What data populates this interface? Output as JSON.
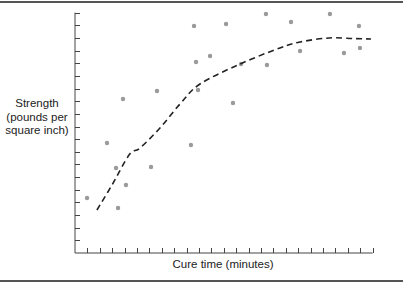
{
  "chart_data": {
    "type": "scatter",
    "title": "",
    "xlabel": "Cure time (minutes)",
    "ylabel_lines": [
      "Strength",
      "(pounds per",
      "square inch)"
    ],
    "ylabel": "Strength (pounds per square inch)",
    "x_tick_count": 24,
    "y_tick_count": 19,
    "tick_labels": "none",
    "grid": false,
    "legend": null,
    "xlim": [
      0,
      24
    ],
    "ylim": [
      0,
      19
    ],
    "units_note": "values in tick units (axes unlabeled)",
    "points": [
      {
        "x": 0.97,
        "y": 4.35
      },
      {
        "x": 2.58,
        "y": 8.7
      },
      {
        "x": 3.31,
        "y": 6.72
      },
      {
        "x": 3.47,
        "y": 3.56
      },
      {
        "x": 3.87,
        "y": 12.17
      },
      {
        "x": 4.11,
        "y": 5.38
      },
      {
        "x": 6.13,
        "y": 6.8
      },
      {
        "x": 6.61,
        "y": 12.81
      },
      {
        "x": 9.35,
        "y": 8.54
      },
      {
        "x": 9.6,
        "y": 17.94
      },
      {
        "x": 9.76,
        "y": 15.1
      },
      {
        "x": 9.92,
        "y": 12.89
      },
      {
        "x": 10.89,
        "y": 15.57
      },
      {
        "x": 12.18,
        "y": 18.1
      },
      {
        "x": 12.74,
        "y": 11.86
      },
      {
        "x": 13.39,
        "y": 14.94
      },
      {
        "x": 15.4,
        "y": 18.89
      },
      {
        "x": 15.48,
        "y": 14.86
      },
      {
        "x": 17.42,
        "y": 18.26
      },
      {
        "x": 18.15,
        "y": 15.97
      },
      {
        "x": 20.56,
        "y": 18.89
      },
      {
        "x": 21.69,
        "y": 15.81
      },
      {
        "x": 22.9,
        "y": 17.94
      },
      {
        "x": 22.98,
        "y": 16.21
      }
    ],
    "trend_line": {
      "style": "dashed",
      "kind": "quadratic fit",
      "points": [
        {
          "x": 1.77,
          "y": 3.4
        },
        {
          "x": 3.0,
          "y": 5.4
        },
        {
          "x": 4.4,
          "y": 7.8
        },
        {
          "x": 5.24,
          "y": 8.3
        },
        {
          "x": 6.85,
          "y": 9.88
        },
        {
          "x": 8.47,
          "y": 11.78
        },
        {
          "x": 10.08,
          "y": 13.36
        },
        {
          "x": 13.31,
          "y": 14.94
        },
        {
          "x": 16.53,
          "y": 16.21
        },
        {
          "x": 18.15,
          "y": 16.68
        },
        {
          "x": 20.5,
          "y": 17.0
        },
        {
          "x": 22.5,
          "y": 16.95
        },
        {
          "x": 23.87,
          "y": 16.92
        }
      ]
    },
    "colors": {
      "points": "#9a9a9a",
      "trend_line": "#222222",
      "axes": "#444444"
    }
  }
}
